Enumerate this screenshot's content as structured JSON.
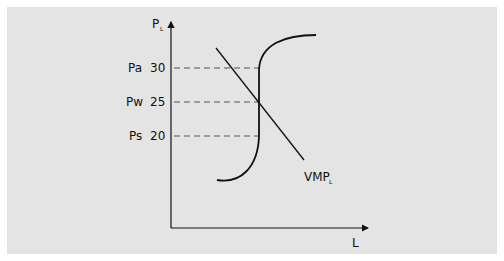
{
  "diagram": {
    "y_axis": {
      "label": "P",
      "subscript": "L"
    },
    "x_axis": {
      "label": "L"
    },
    "price_levels": [
      {
        "name": "Pa",
        "value": "30"
      },
      {
        "name": "Pw",
        "value": "25"
      },
      {
        "name": "Ps",
        "value": "20"
      }
    ],
    "curves": {
      "vmp": {
        "label": "VMP",
        "subscript": "L"
      },
      "supply": {
        "label": ""
      }
    },
    "colors": {
      "background": "#e4e4e4",
      "line": "#111111",
      "dash": "#555555"
    }
  }
}
